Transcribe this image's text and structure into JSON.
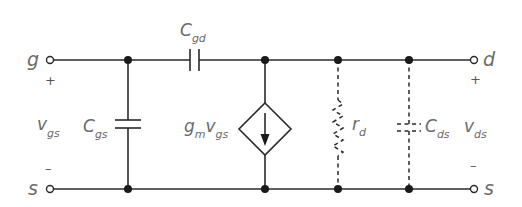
{
  "diagram": {
    "terminals": {
      "gate": "g",
      "drain": "d",
      "source_left": "s",
      "source_right": "s"
    },
    "polarity": {
      "vgs_plus": "+",
      "vgs_minus": "–",
      "vds_plus": "+",
      "vds_minus": "–"
    },
    "components": {
      "cgd": {
        "main": "C",
        "sub": "gd"
      },
      "cgs": {
        "main": "C",
        "sub": "gs"
      },
      "current_source": {
        "coef": "g",
        "coef_sub": "m",
        "var": "v",
        "var_sub": "gs"
      },
      "rd": {
        "main": "r",
        "sub": "d"
      },
      "cds": {
        "main": "C",
        "sub": "ds"
      }
    },
    "voltages": {
      "vgs": {
        "main": "v",
        "sub": "gs"
      },
      "vds": {
        "main": "v",
        "sub": "ds"
      }
    },
    "colors": {
      "wire": "#2a2a2a",
      "label": "#6b6b6b",
      "background": "#ffffff"
    }
  }
}
